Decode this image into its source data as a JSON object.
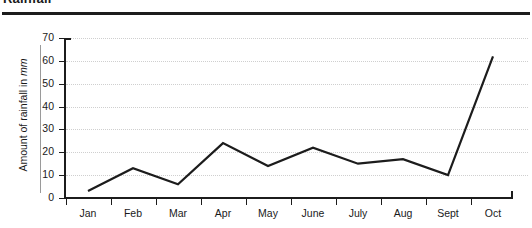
{
  "title": "Rainfall",
  "axes": {
    "ylabel_text": "Amount of rainfall in ",
    "ylabel_unit": "mm",
    "yticks": [
      0,
      10,
      20,
      30,
      40,
      50,
      60,
      70
    ],
    "xticks": [
      "Jan",
      "Feb",
      "Mar",
      "Apr",
      "May",
      "June",
      "July",
      "Aug",
      "Sept",
      "Oct"
    ]
  },
  "chart_data": {
    "type": "line",
    "title": "Rainfall",
    "xlabel": "",
    "ylabel": "Amount of rainfall in mm",
    "categories": [
      "Jan",
      "Feb",
      "Mar",
      "Apr",
      "May",
      "June",
      "July",
      "Aug",
      "Sept",
      "Oct"
    ],
    "values": [
      3,
      13,
      6,
      24,
      14,
      22,
      15,
      17,
      10,
      62
    ],
    "ylim": [
      0,
      70
    ],
    "ytick_step": 10,
    "grid": true,
    "legend": "none",
    "line_color": "#1c1c1c",
    "markers": false
  }
}
